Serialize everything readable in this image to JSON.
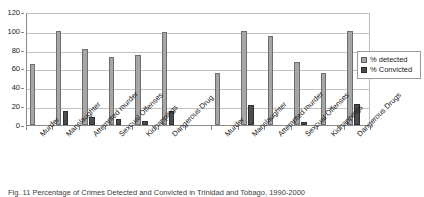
{
  "caption": "Fig. 11  Percentage of Crimes Detected and Convicted in Trinidad and Tobago, 1990-2000",
  "legend": {
    "position": "right",
    "entries": [
      {
        "label": "% detected",
        "color": "#a6a6a6",
        "icon": "legend-swatch"
      },
      {
        "label": "% Convicted",
        "color": "#4d4d4d",
        "icon": "legend-swatch"
      }
    ]
  },
  "axis": {
    "y_ticks": [
      "120",
      "100",
      "80",
      "60",
      "40",
      "20",
      "0"
    ],
    "y_min": 0,
    "y_max": 120,
    "y_step": 20
  },
  "chart_data": {
    "type": "bar",
    "title": "",
    "subtitle": "",
    "xlabel": "",
    "ylabel": "",
    "ylim": [
      0,
      120
    ],
    "ytick_step": 20,
    "grid": true,
    "legend_position": "right",
    "groups": [
      {
        "name": "group-left",
        "categories": [
          "Murder",
          "Manslaughter",
          "Attempted murder",
          "Sexcual Offenses",
          "Kidnappings",
          "Dangerous Drug"
        ],
        "series": [
          {
            "name": "% detected",
            "values": [
              65,
              100,
              81,
              72,
              74,
              99
            ]
          },
          {
            "name": "% Convicted",
            "values": [
              0,
              15,
              8,
              6,
              4,
              15
            ]
          }
        ]
      },
      {
        "name": "group-right",
        "categories": [
          "Murder",
          "Manslaughter",
          "Attempted murder",
          "Sexcual Offenses",
          "Kidnappings",
          "Dangerous Drugs"
        ],
        "series": [
          {
            "name": "% detected",
            "values": [
              55,
              100,
              94,
              67,
              55,
              100
            ]
          },
          {
            "name": "% Convicted",
            "values": [
              0,
              21,
              0,
              3,
              0,
              22
            ]
          }
        ]
      }
    ]
  }
}
